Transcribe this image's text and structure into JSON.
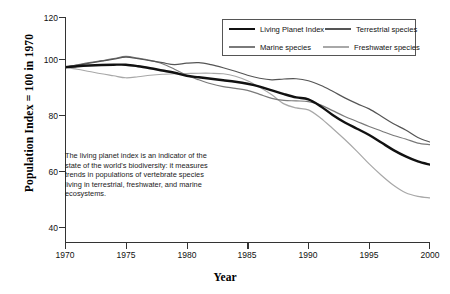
{
  "chart_data": {
    "type": "line",
    "title": "",
    "xlabel": "Year",
    "ylabel": "Population Index = 100 in 1970",
    "xlim": [
      1970,
      2000
    ],
    "ylim": [
      30,
      120
    ],
    "grid": false,
    "legend_position": "top-right",
    "xticks": [
      "1970",
      "1975",
      "1980",
      "1985",
      "1990",
      "1995",
      "2000"
    ],
    "yticks": [
      "120",
      "100",
      "80",
      "60",
      "40"
    ],
    "x": [
      1970,
      1971,
      1972,
      1973,
      1974,
      1975,
      1976,
      1977,
      1978,
      1979,
      1980,
      1981,
      1982,
      1983,
      1984,
      1985,
      1986,
      1987,
      1988,
      1989,
      1990,
      1991,
      1992,
      1993,
      1994,
      1995,
      1996,
      1997,
      1998,
      1999,
      2000
    ],
    "series": [
      {
        "name": "Living Planet Index",
        "color": "#111111",
        "width": 2.4,
        "values": [
          100,
          100.4,
          100.7,
          100.9,
          101,
          101,
          100.4,
          99.6,
          98.7,
          97.8,
          96.6,
          96,
          95.4,
          94.8,
          94.2,
          93.4,
          92.3,
          90.8,
          89.3,
          88,
          87.2,
          84.5,
          81,
          78,
          75.5,
          73,
          70,
          67,
          64.5,
          62.5,
          61.2
        ]
      },
      {
        "name": "Terrestrial species",
        "color": "#555555",
        "width": 1.2,
        "values": [
          100,
          100.8,
          101.6,
          102.4,
          103.2,
          104,
          103.4,
          102.6,
          101.8,
          101,
          101.6,
          101.8,
          101,
          99.8,
          98.4,
          96.8,
          95.6,
          95,
          95.3,
          95.4,
          94.6,
          92.8,
          90.4,
          87.8,
          85.5,
          83.4,
          80.5,
          77.5,
          75,
          72,
          70.2
        ]
      },
      {
        "name": "Marine species",
        "color": "#7a7a7a",
        "width": 1.2,
        "values": [
          100,
          100.9,
          101.8,
          102.6,
          103.4,
          104.3,
          103.6,
          102.7,
          101.4,
          99.2,
          96.8,
          95,
          93.4,
          92.3,
          91.6,
          90.8,
          89.2,
          87.6,
          86.8,
          86.6,
          86.3,
          85,
          82.7,
          80.4,
          78.4,
          76.4,
          74.6,
          72.8,
          71.4,
          69.8,
          69.2
        ]
      },
      {
        "name": "Freshwater species",
        "color": "#a8a8a8",
        "width": 1.2,
        "values": [
          100,
          99.2,
          98.3,
          97.4,
          96.6,
          95.8,
          96.2,
          96.8,
          97.2,
          97.4,
          97.5,
          97.6,
          97.6,
          97.4,
          96.4,
          94.6,
          92,
          89,
          85.4,
          83.8,
          83,
          79.8,
          75.6,
          71.2,
          66.5,
          61.5,
          57,
          53,
          50,
          48.6,
          48
        ]
      }
    ],
    "annotation": "The living planet index is an indicator of the state of the world's biodiversity: it measures trends in populations of vertebrate species living in terrestrial, freshwater, and marine ecosystems.",
    "axis_color": "#333333"
  }
}
